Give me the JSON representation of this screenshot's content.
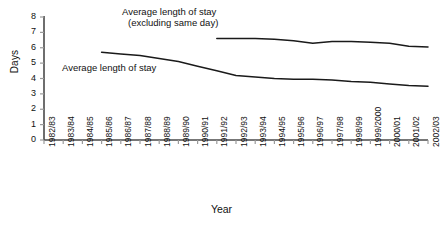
{
  "chart_data": {
    "type": "line",
    "title": "",
    "xlabel": "Year",
    "ylabel": "Days",
    "ylim": [
      0,
      8
    ],
    "yticks": [
      0,
      1,
      2,
      3,
      4,
      5,
      6,
      7,
      8
    ],
    "grid": false,
    "legend_position": "inline-annotations",
    "categories": [
      "1982/83",
      "1983/84",
      "1984/85",
      "1985/86",
      "1986/87",
      "1987/88",
      "1988/89",
      "1989/90",
      "1990/91",
      "1991/92",
      "1992/93",
      "1993/94",
      "1994/95",
      "1995/96",
      "1996/97",
      "1997/98",
      "1998/99",
      "1999/2000",
      "2000/01",
      "2001/02",
      "2002/03"
    ],
    "series": [
      {
        "name": "Average length of stay",
        "values": [
          null,
          null,
          null,
          5.7,
          5.6,
          5.5,
          5.3,
          5.1,
          4.8,
          4.5,
          4.2,
          4.1,
          4.0,
          3.95,
          3.95,
          3.9,
          3.8,
          3.75,
          3.65,
          3.55,
          3.5
        ]
      },
      {
        "name": "Average length of stay (excluding same day)",
        "values": [
          null,
          null,
          null,
          null,
          null,
          null,
          null,
          null,
          null,
          6.6,
          6.6,
          6.6,
          6.55,
          6.45,
          6.3,
          6.4,
          6.4,
          6.35,
          6.3,
          6.1,
          6.05
        ]
      }
    ],
    "annotations": [
      {
        "id": "annot-excluding",
        "line1": "Average length of stay",
        "line2": "(excluding same day)"
      },
      {
        "id": "annot-all",
        "text": "Average length of stay"
      }
    ],
    "colors": {
      "line": "#1a1a1a",
      "axis": "#4a4a4a",
      "tick": "#9a9a9a",
      "background": "#ffffff"
    }
  },
  "axis": {
    "y_title": "Days",
    "x_title": "Year",
    "y_tick_labels": [
      "0",
      "1",
      "2",
      "3",
      "4",
      "5",
      "6",
      "7",
      "8"
    ],
    "x_tick_labels": [
      "1982/83",
      "1983/84",
      "1984/85",
      "1985/86",
      "1986/87",
      "1987/88",
      "1988/89",
      "1989/90",
      "1990/91",
      "1991/92",
      "1992/93",
      "1993/94",
      "1994/95",
      "1995/96",
      "1996/97",
      "1997/98",
      "1998/99",
      "1999/2000",
      "2000/01",
      "2001/02",
      "2002/03"
    ]
  },
  "annotations": {
    "excluding_line1": "Average length of stay",
    "excluding_line2": "(excluding same day)",
    "all_stays": "Average length of stay"
  }
}
